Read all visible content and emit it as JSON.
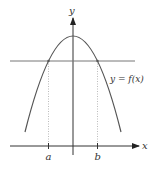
{
  "diagram": {
    "type": "function-graph",
    "labels": {
      "y_axis": "y",
      "x_axis": "x",
      "curve": "y = f(x)",
      "point_a": "a",
      "point_b": "b"
    },
    "colors": {
      "axis": "#333333",
      "curve": "#555555",
      "horizontal_line": "#777777",
      "guide": "#999999",
      "text": "#333333"
    },
    "elements": [
      "parabola opening downward, vertex on y-axis",
      "horizontal line crossing parabola at two points",
      "dotted vertical guides from intersections down to a and b on x-axis"
    ]
  }
}
